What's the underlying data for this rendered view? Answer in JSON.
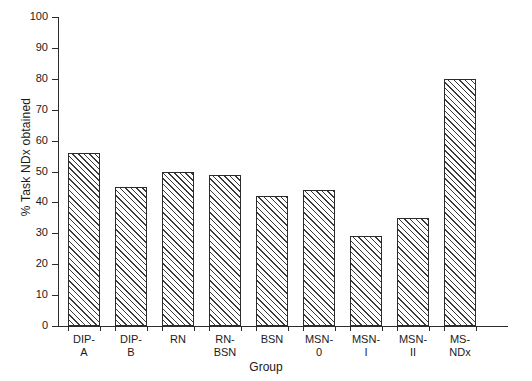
{
  "chart_data": {
    "type": "bar",
    "title": "",
    "xlabel": "Group",
    "ylabel": "% Task NDx obtained",
    "categories": [
      "DIP-A",
      "DIP-B",
      "RN",
      "RN-BSN",
      "BSN",
      "MSN-0",
      "MSN-I",
      "MSN-II",
      "MS-NDx"
    ],
    "category_lines": [
      [
        "DIP-",
        "A"
      ],
      [
        "DIP-",
        "B"
      ],
      [
        "RN",
        ""
      ],
      [
        "RN-",
        "BSN"
      ],
      [
        "BSN",
        ""
      ],
      [
        "MSN-",
        "0"
      ],
      [
        "MSN-",
        "I"
      ],
      [
        "MSN-",
        "II"
      ],
      [
        "MS-",
        "NDx"
      ]
    ],
    "values": [
      56,
      45,
      50,
      49,
      42,
      44,
      29,
      35,
      80
    ],
    "ylim": [
      0,
      100
    ],
    "yticks": [
      0,
      10,
      20,
      30,
      40,
      50,
      60,
      70,
      80,
      90,
      100
    ],
    "ytick_labels": [
      "0",
      "10",
      "20",
      "30",
      "40",
      "50",
      "60",
      "70",
      "80",
      "90",
      "100"
    ],
    "grid": false,
    "legend": null,
    "bar_fill": "hatched-diagonal",
    "bar_edge_color": "#2b2b2b",
    "background_color": "#ffffff"
  }
}
